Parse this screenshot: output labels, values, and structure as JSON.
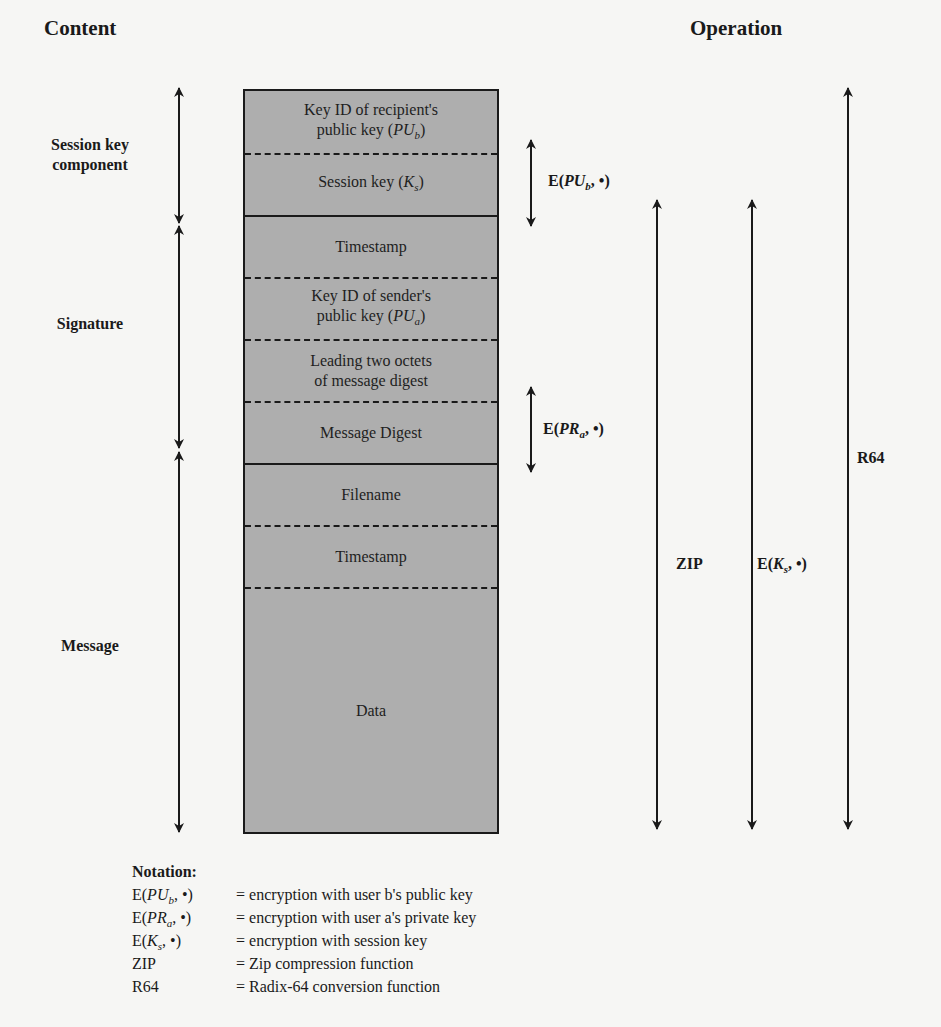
{
  "headings": {
    "content": "Content",
    "operation": "Operation"
  },
  "groups": [
    {
      "label_line1": "Session key",
      "label_line2": "component",
      "arrow_top": 88,
      "arrow_bottom": 223
    },
    {
      "label_line1": "Signature",
      "label_line2": "",
      "arrow_top": 226,
      "arrow_bottom": 448
    },
    {
      "label_line1": "Message",
      "label_line2": "",
      "arrow_top": 452,
      "arrow_bottom": 832
    }
  ],
  "fields": [
    {
      "line1": "Key ID of recipient's",
      "line2_prefix": "public key (",
      "var": "PU",
      "sub": "b",
      "line2_suffix": ")",
      "top": 89,
      "bottom": 152,
      "separator_below": "dashed"
    },
    {
      "line1": "",
      "line2_prefix": "Session key (",
      "var": "K",
      "sub": "s",
      "line2_suffix": ")",
      "top": 152,
      "bottom": 214,
      "separator_below": "solid"
    },
    {
      "line1": "",
      "line2_prefix": "Timestamp",
      "var": "",
      "sub": "",
      "line2_suffix": "",
      "top": 214,
      "bottom": 276,
      "separator_below": "dashed"
    },
    {
      "line1": "Key ID of sender's",
      "line2_prefix": "public key (",
      "var": "PU",
      "sub": "a",
      "line2_suffix": ")",
      "top": 276,
      "bottom": 338,
      "separator_below": "dashed"
    },
    {
      "line1": "Leading two octets",
      "line2_prefix": "of message digest",
      "var": "",
      "sub": "",
      "line2_suffix": "",
      "top": 338,
      "bottom": 400,
      "separator_below": "dashed"
    },
    {
      "line1": "",
      "line2_prefix": "Message Digest",
      "var": "",
      "sub": "",
      "line2_suffix": "",
      "top": 400,
      "bottom": 462,
      "separator_below": "solid"
    },
    {
      "line1": "",
      "line2_prefix": "Filename",
      "var": "",
      "sub": "",
      "line2_suffix": "",
      "top": 462,
      "bottom": 524,
      "separator_below": "dashed"
    },
    {
      "line1": "",
      "line2_prefix": "Timestamp",
      "var": "",
      "sub": "",
      "line2_suffix": "",
      "top": 524,
      "bottom": 586,
      "separator_below": "dashed"
    },
    {
      "line1": "",
      "line2_prefix": "Data",
      "var": "",
      "sub": "",
      "line2_suffix": "",
      "top": 586,
      "bottom": 832,
      "separator_below": "none"
    }
  ],
  "operations": [
    {
      "id": "e-pub",
      "label_prefix": "E(",
      "var": "PU",
      "sub": "b",
      "label_suffix": ", •)",
      "x": 531,
      "top": 140,
      "bottom": 226,
      "label_x": 548,
      "label_y": 172
    },
    {
      "id": "e-pra",
      "label_prefix": "E(",
      "var": "PR",
      "sub": "a",
      "label_suffix": ", •)",
      "x": 531,
      "top": 387,
      "bottom": 472,
      "label_x": 543,
      "label_y": 420
    },
    {
      "id": "zip",
      "label_prefix": "ZIP",
      "var": "",
      "sub": "",
      "label_suffix": "",
      "x": 657,
      "top": 200,
      "bottom": 829,
      "label_x": 676,
      "label_y": 555
    },
    {
      "id": "e-ks",
      "label_prefix": "E(",
      "var": "K",
      "sub": "s",
      "label_suffix": ", •)",
      "x": 752,
      "top": 200,
      "bottom": 829,
      "label_x": 757,
      "label_y": 555
    },
    {
      "id": "r64",
      "label_prefix": "R64",
      "var": "",
      "sub": "",
      "label_suffix": "",
      "x": 848,
      "top": 88,
      "bottom": 829,
      "label_x": 857,
      "label_y": 449
    }
  ],
  "notation": {
    "title": "Notation:",
    "rows": [
      {
        "term_prefix": "E(",
        "var": "PU",
        "sub": "b",
        "term_suffix": ", •)",
        "def": "= encryption with user b's public key"
      },
      {
        "term_prefix": "E(",
        "var": "PR",
        "sub": "a",
        "term_suffix": ", •)",
        "def": "= encryption with user a's private key"
      },
      {
        "term_prefix": "E(",
        "var": "K",
        "sub": "s",
        "term_suffix": ", •)",
        "def": "= encryption with session key"
      },
      {
        "term_prefix": "ZIP",
        "var": "",
        "sub": "",
        "term_suffix": "",
        "def": "= Zip compression function"
      },
      {
        "term_prefix": "R64",
        "var": "",
        "sub": "",
        "term_suffix": "",
        "def": "= Radix-64 conversion function"
      }
    ]
  },
  "colors": {
    "background": "#f6f6f4",
    "packet_fill": "#aeaeae",
    "ink": "#1a1a1a"
  }
}
